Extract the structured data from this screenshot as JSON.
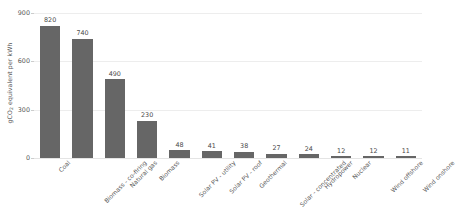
{
  "chart_data": {
    "type": "bar",
    "title": "",
    "xlabel": "",
    "ylabel": "gCO2 equivalent per kWh",
    "ylabel_parts": {
      "prefix": "gCO",
      "sub": "2",
      "suffix": " equivalent per kWh"
    },
    "categories": [
      "Coal",
      "Biomass - co-firing",
      "Natural gas",
      "Biomass",
      "Solar PV - utility",
      "Solar PV - roof",
      "Geothermal",
      "Solar - concentrated",
      "Hydropower",
      "Nuclear",
      "Wind offshore",
      "Wind onshore"
    ],
    "values": [
      820,
      740,
      490,
      230,
      48,
      41,
      38,
      27,
      24,
      12,
      12,
      11
    ],
    "value_labels": [
      "820",
      "740",
      "490",
      "230",
      "48",
      "41",
      "38",
      "27",
      "24",
      "12",
      "12",
      "11"
    ],
    "ylim": [
      0,
      900
    ],
    "yticks": [
      0,
      300,
      600,
      900
    ],
    "ytick_labels": [
      "0",
      "300",
      "600",
      "900"
    ],
    "grid": true,
    "legend": "none",
    "bar_color": "#666666",
    "grid_color": "#ededed",
    "background_color": "#ffffff",
    "text_color": "#555555"
  }
}
